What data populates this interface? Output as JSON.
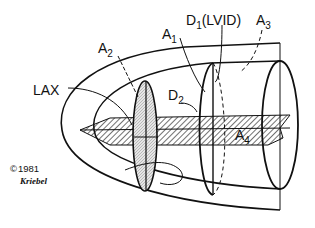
{
  "diagram": {
    "labels": {
      "lax": "LAX",
      "a2_main": "A",
      "a2_sub": "2",
      "a1_main": "A",
      "a1_sub": "1",
      "d1_main": "D",
      "d1_sub": "1",
      "d1_paren": "(LVID)",
      "a3_main": "A",
      "a3_sub": "3",
      "d2_main": "D",
      "d2_sub": "2",
      "a4_main": "A",
      "a4_sub": "4"
    },
    "copyright": {
      "symbol": "©",
      "year": "1981",
      "signature": "Kriebel"
    },
    "colors": {
      "line": "#111111",
      "background": "#ffffff"
    }
  }
}
